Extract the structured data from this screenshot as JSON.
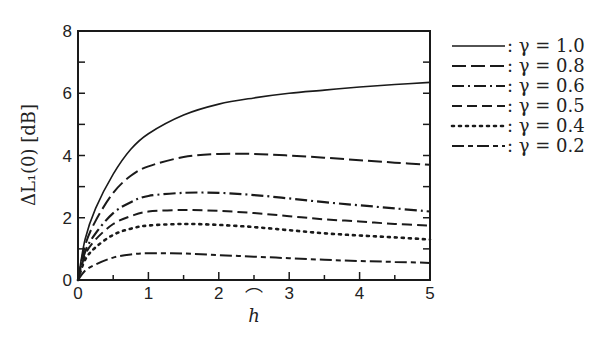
{
  "chart_data": {
    "type": "line",
    "title": "",
    "xlabel": "ĥ",
    "ylabel": "ΔL₁(0)  [dB]",
    "xlim": [
      0,
      5
    ],
    "ylim": [
      0,
      8
    ],
    "x_ticks": [
      "0",
      "1",
      "2",
      "3",
      "4",
      "5"
    ],
    "y_ticks": [
      "0",
      "2",
      "4",
      "6",
      "8"
    ],
    "grid": false,
    "legend_position": "right-outside",
    "x": [
      0,
      0.1,
      0.25,
      0.5,
      0.75,
      1.0,
      1.5,
      2.0,
      2.5,
      3.0,
      3.5,
      4.0,
      4.5,
      5.0
    ],
    "series": [
      {
        "name": "γ = 1.0",
        "style": "solid",
        "values": [
          0,
          1.3,
          2.3,
          3.4,
          4.2,
          4.7,
          5.3,
          5.65,
          5.85,
          6.0,
          6.1,
          6.2,
          6.28,
          6.35
        ]
      },
      {
        "name": "γ = 0.8",
        "style": "long-dash",
        "values": [
          0,
          1.1,
          1.9,
          2.8,
          3.35,
          3.65,
          3.95,
          4.05,
          4.05,
          4.0,
          3.93,
          3.85,
          3.77,
          3.7
        ]
      },
      {
        "name": "γ = 0.6",
        "style": "dash-dot",
        "values": [
          0,
          0.9,
          1.5,
          2.15,
          2.5,
          2.7,
          2.8,
          2.8,
          2.73,
          2.62,
          2.5,
          2.4,
          2.3,
          2.2
        ]
      },
      {
        "name": "γ = 0.5",
        "style": "dash",
        "values": [
          0,
          0.8,
          1.3,
          1.8,
          2.05,
          2.2,
          2.25,
          2.22,
          2.15,
          2.05,
          1.95,
          1.88,
          1.8,
          1.75
        ]
      },
      {
        "name": "γ = 0.4",
        "style": "dotted",
        "values": [
          0,
          0.65,
          1.05,
          1.45,
          1.65,
          1.75,
          1.8,
          1.77,
          1.7,
          1.6,
          1.5,
          1.43,
          1.37,
          1.3
        ]
      },
      {
        "name": "γ = 0.2",
        "style": "dash-short",
        "values": [
          0,
          0.3,
          0.5,
          0.72,
          0.82,
          0.86,
          0.85,
          0.8,
          0.75,
          0.7,
          0.65,
          0.61,
          0.58,
          0.55
        ]
      }
    ]
  },
  "legend": {
    "items": [
      {
        "label": ": γ = 1.0"
      },
      {
        "label": ": γ = 0.8"
      },
      {
        "label": ": γ = 0.6"
      },
      {
        "label": ": γ = 0.5"
      },
      {
        "label": ": γ = 0.4"
      },
      {
        "label": ": γ = 0.2"
      }
    ]
  },
  "axes": {
    "xlabel": "h",
    "xlabel_hat": "⌒",
    "ylabel": "ΔL₁(0)   [dB]",
    "line_color": "#1a1a1a"
  }
}
